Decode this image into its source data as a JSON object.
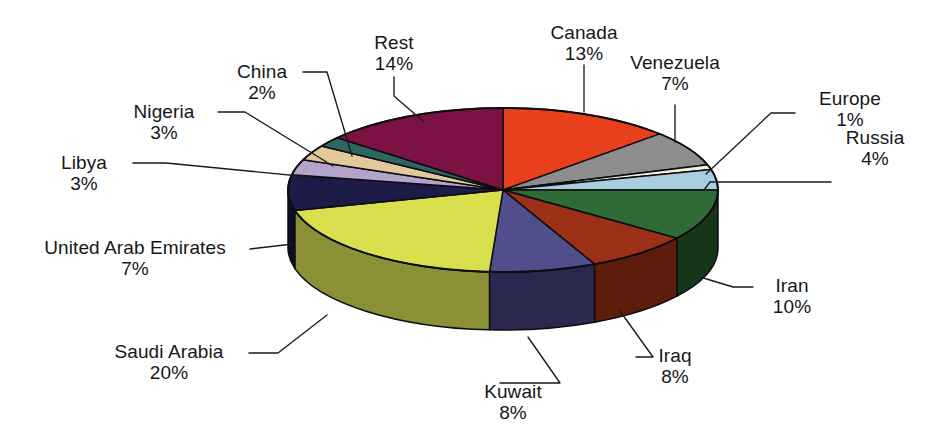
{
  "chart_data": {
    "type": "pie",
    "title": "",
    "subtitle": "",
    "xlabel": "",
    "ylabel": "",
    "legend_position": "none",
    "grid": false,
    "style": "3d-exploded-disc",
    "units": "percent",
    "total": 100,
    "categories": [
      "Canada",
      "Venezuela",
      "Europe",
      "Russia",
      "Iran",
      "Iraq",
      "Kuwait",
      "Saudi Arabia",
      "United Arab Emirates",
      "Libya",
      "Nigeria",
      "China",
      "Rest"
    ],
    "values": [
      13,
      7,
      1,
      4,
      10,
      8,
      8,
      20,
      7,
      3,
      3,
      2,
      14
    ],
    "labels": [
      "13%",
      "7%",
      "1%",
      "4%",
      "10%",
      "8%",
      "8%",
      "20%",
      "7%",
      "3%",
      "3%",
      "2%",
      "14%"
    ],
    "colors": [
      "#e8401c",
      "#8d8d8d",
      "#f4f0dd",
      "#a8cee0",
      "#2f6b34",
      "#9b3016",
      "#514e8c",
      "#d9e04e",
      "#1d1b47",
      "#b3a3c8",
      "#e3c89b",
      "#2f6560",
      "#7c1143"
    ],
    "side_colors": [
      "#8a2510",
      "#5c5c5c",
      "#b5b09e",
      "#6f8fa0",
      "#16361a",
      "#5e1c0c",
      "#2b2850",
      "#8a9035",
      "#0e0d26",
      "#7a6f8a",
      "#9b8866",
      "#1c3d3a",
      "#4c0a2a"
    ],
    "slices": [
      {
        "name": "Canada",
        "value": 13,
        "label": "13%",
        "color": "#e8401c"
      },
      {
        "name": "Venezuela",
        "value": 7,
        "label": "7%",
        "color": "#8d8d8d"
      },
      {
        "name": "Europe",
        "value": 1,
        "label": "1%",
        "color": "#f4f0dd"
      },
      {
        "name": "Russia",
        "value": 4,
        "label": "4%",
        "color": "#a8cee0"
      },
      {
        "name": "Iran",
        "value": 10,
        "label": "10%",
        "color": "#2f6b34"
      },
      {
        "name": "Iraq",
        "value": 8,
        "label": "8%",
        "color": "#9b3016"
      },
      {
        "name": "Kuwait",
        "value": 8,
        "label": "8%",
        "color": "#514e8c"
      },
      {
        "name": "Saudi Arabia",
        "value": 20,
        "label": "20%",
        "color": "#d9e04e"
      },
      {
        "name": "United Arab Emirates",
        "value": 7,
        "label": "7%",
        "color": "#1d1b47"
      },
      {
        "name": "Libya",
        "value": 3,
        "label": "3%",
        "color": "#b3a3c8"
      },
      {
        "name": "Nigeria",
        "value": 3,
        "label": "3%",
        "color": "#e3c89b"
      },
      {
        "name": "China",
        "value": 2,
        "label": "2%",
        "color": "#2f6560"
      },
      {
        "name": "Rest",
        "value": 14,
        "label": "14%",
        "color": "#7c1143"
      }
    ]
  },
  "callouts": {
    "rest": {
      "name": "Rest",
      "pct": "14%"
    },
    "canada": {
      "name": "Canada",
      "pct": "13%"
    },
    "venezuela": {
      "name": "Venezuela",
      "pct": "7%"
    },
    "europe": {
      "name": "Europe",
      "pct": "1%"
    },
    "russia": {
      "name": "Russia",
      "pct": "4%"
    },
    "iran": {
      "name": "Iran",
      "pct": "10%"
    },
    "iraq": {
      "name": "Iraq",
      "pct": "8%"
    },
    "kuwait": {
      "name": "Kuwait",
      "pct": "8%"
    },
    "saudi": {
      "name": "Saudi Arabia",
      "pct": "20%"
    },
    "uae": {
      "name": "United Arab Emirates",
      "pct": "7%"
    },
    "libya": {
      "name": "Libya",
      "pct": "3%"
    },
    "nigeria": {
      "name": "Nigeria",
      "pct": "3%"
    },
    "china": {
      "name": "China",
      "pct": "2%"
    }
  },
  "theme": {
    "background": "#ffffff",
    "text_color": "#16161a",
    "leader_color": "#1a1a1a",
    "slice_outline": "#0d0d0f"
  }
}
